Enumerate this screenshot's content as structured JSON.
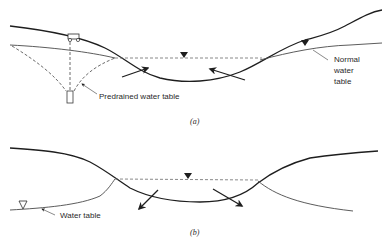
{
  "figure": {
    "panels": [
      {
        "id": "a",
        "caption": "(a)",
        "labels": {
          "predrained": "Predrained water table",
          "normal_line1": "Normal",
          "normal_line2": "water",
          "normal_line3": "table"
        },
        "elements": [
          "ground-surface",
          "normal-water-table",
          "predrained-water-table-cone",
          "well",
          "pump-vehicle",
          "stream-water-level",
          "inflow-arrows"
        ]
      },
      {
        "id": "b",
        "caption": "(b)",
        "labels": {
          "water_table": "Water table"
        },
        "elements": [
          "ground-surface",
          "water-table",
          "stream-water-level",
          "outflow-arrows"
        ]
      }
    ],
    "colors": {
      "line": "#1e1e1e",
      "thin_line": "#4a4a4a",
      "dashed": "#6a6a6a",
      "background": "#ffffff"
    }
  }
}
